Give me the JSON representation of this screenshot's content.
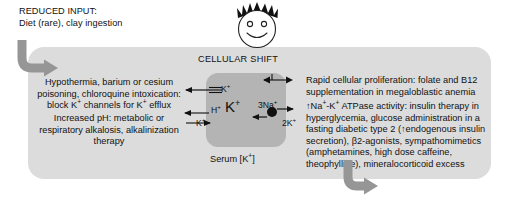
{
  "diagram": {
    "title_block": {
      "lines": [
        "REDUCED INPUT:",
        "Diet (rare), clay ingestion"
      ]
    },
    "center": {
      "cellular_shift_label": "CELLULAR SHIFT",
      "cell_interior_label": "K+",
      "serum_label": "Serum [K+]",
      "face_icon": "smiley-face-with-spiky-hair"
    },
    "channels": {
      "k_efflux_label": "K+",
      "h_exchange_label": "H+",
      "k_influx_label": "K+",
      "pump_na_label": "3Na+",
      "pump_k_label": "2K+"
    },
    "left_blocks": [
      {
        "name": "k-channel-block",
        "lines": [
          "Hypothermia, barium or cesium",
          "poisoning, chloroquine intoxication:",
          "block K+ channels for K+ efflux"
        ]
      },
      {
        "name": "ph-block",
        "lines": [
          "Increased pH: metabolic or",
          "respiratory alkalosis, alkalinization",
          "therapy"
        ]
      }
    ],
    "right_blocks": [
      {
        "name": "proliferation-block",
        "lines": [
          "Rapid cellular proliferation: folate and B12",
          "supplementation in megaloblastic anemia"
        ]
      },
      {
        "name": "atpase-block",
        "lines": [
          "↑Na+-K+ ATPase activity: insulin therapy in",
          "hyperglycemia, glucose administration in a",
          "fasting diabetic type 2 (↑endogenous insulin",
          "secretion), β2-agonists, sympathomimetics",
          "(amphetamines, high dose caffeine,",
          "theophylline), mineralocorticoid excess"
        ]
      }
    ],
    "arrows": {
      "top_left_curved": "curved-arrow-down-right",
      "bottom_right_curved": "curved-arrow-down-right"
    },
    "colors": {
      "panel_background": "#dcdcdc",
      "cell_fill": "#b4b4b4",
      "curved_arrow": "#969696",
      "text": "#111111",
      "page_background": "#ffffff"
    }
  }
}
